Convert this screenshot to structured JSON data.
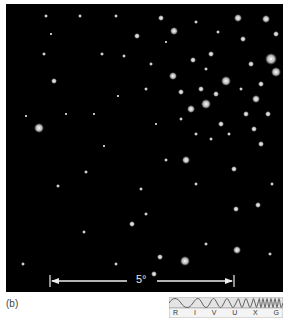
{
  "figure": {
    "panel_label": "(b)",
    "scale_bar": {
      "label": "5°"
    },
    "spectrum_icon": {
      "bands": [
        "R",
        "I",
        "V",
        "U",
        "X",
        "G"
      ],
      "highlighted_band": "I"
    },
    "image_description": "Star field, dense cluster toward upper right, black sky background"
  }
}
